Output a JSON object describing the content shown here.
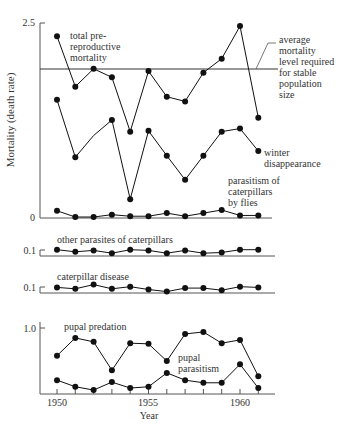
{
  "chart_data": [
    {
      "type": "line",
      "panel": "top",
      "title": "",
      "xlabel": "",
      "ylabel": "Mortality (death rate)",
      "ylim": [
        0,
        2.5
      ],
      "yticks": [
        "0",
        "2.5"
      ],
      "grid": false,
      "x": [
        1950,
        1951,
        1952,
        1953,
        1954,
        1955,
        1956,
        1957,
        1958,
        1959,
        1960,
        1961
      ],
      "reference_line": {
        "value": 1.9,
        "label": [
          "average",
          "mortality",
          "level required",
          "for stable",
          "population",
          "size"
        ]
      },
      "series": [
        {
          "name": "total pre-reproductive mortality",
          "label_lines": [
            "total pre-",
            "reproductive",
            "mortality"
          ],
          "values": [
            2.33,
            1.68,
            1.91,
            1.8,
            1.1,
            1.88,
            1.55,
            1.49,
            1.86,
            2.04,
            2.46,
            1.28
          ],
          "markers": [
            true,
            true,
            true,
            true,
            true,
            true,
            true,
            true,
            true,
            true,
            true,
            true
          ]
        },
        {
          "name": "winter disappearance",
          "label_lines": [
            "winter",
            "disappearance"
          ],
          "values": [
            1.51,
            0.77,
            1.05,
            1.25,
            0.23,
            1.11,
            0.79,
            0.48,
            0.79,
            1.1,
            1.14,
            0.85
          ],
          "markers": [
            true,
            true,
            false,
            true,
            true,
            true,
            true,
            true,
            true,
            true,
            true,
            true
          ]
        },
        {
          "name": "parasitism of caterpillars by flies",
          "label_lines": [
            "parasitism of",
            "caterpillars",
            "by flies"
          ],
          "values": [
            0.08,
            0.0,
            0.0,
            0.03,
            0.01,
            0.01,
            0.05,
            0.01,
            0.05,
            0.09,
            0.02,
            0.02
          ],
          "markers": [
            true,
            true,
            true,
            true,
            true,
            true,
            true,
            true,
            true,
            true,
            true,
            true
          ]
        }
      ]
    },
    {
      "type": "line",
      "panel": "middle-1",
      "title": "other parasites of caterpillars",
      "ylim": [
        0,
        0.1
      ],
      "yticks": [
        "0.1"
      ],
      "x": [
        1950,
        1951,
        1952,
        1953,
        1954,
        1955,
        1956,
        1957,
        1958,
        1959,
        1960,
        1961
      ],
      "series": [
        {
          "name": "other parasites of caterpillars",
          "values": [
            0.09,
            0.06,
            0.08,
            0.04,
            0.09,
            0.08,
            0.04,
            0.08,
            0.04,
            0.05,
            0.09,
            0.09
          ]
        }
      ]
    },
    {
      "type": "line",
      "panel": "middle-2",
      "title": "caterpillar disease",
      "ylim": [
        0,
        0.1
      ],
      "yticks": [
        "0.1"
      ],
      "x": [
        1950,
        1951,
        1952,
        1953,
        1954,
        1955,
        1956,
        1957,
        1958,
        1959,
        1960,
        1961
      ],
      "series": [
        {
          "name": "caterpillar disease",
          "values": [
            0.08,
            0.06,
            0.12,
            0.06,
            0.09,
            0.05,
            0.02,
            0.07,
            0.07,
            0.04,
            0.09,
            0.08
          ]
        }
      ]
    },
    {
      "type": "line",
      "panel": "bottom",
      "xlabel": "Year",
      "ylim": [
        0,
        1.0
      ],
      "yticks": [
        "1.0"
      ],
      "xticks": [
        "1950",
        "1955",
        "1960"
      ],
      "x": [
        1950,
        1951,
        1952,
        1953,
        1954,
        1955,
        1956,
        1957,
        1958,
        1959,
        1960,
        1961
      ],
      "series": [
        {
          "name": "pupal predation",
          "label_lines": [
            "pupal predation"
          ],
          "values": [
            0.58,
            0.85,
            0.79,
            0.36,
            0.77,
            0.76,
            0.5,
            0.91,
            0.94,
            0.77,
            0.82,
            0.27
          ]
        },
        {
          "name": "pupal parasitism",
          "label_lines": [
            "pupal",
            "parasitism"
          ],
          "values": [
            0.21,
            0.11,
            0.06,
            0.18,
            0.09,
            0.11,
            0.32,
            0.21,
            0.17,
            0.17,
            0.45,
            0.09
          ]
        }
      ]
    }
  ],
  "labels": {
    "y_axis_title": "Mortality (death rate)",
    "top_y_max": "2.5",
    "top_y_zero": "0",
    "total_l1": "total pre-",
    "total_l2": "reproductive",
    "total_l3": "mortality",
    "ref_l1": "average",
    "ref_l2": "mortality",
    "ref_l3": "level required",
    "ref_l4": "for stable",
    "ref_l5": "population",
    "ref_l6": "size",
    "winter_l1": "winter",
    "winter_l2": "disappearance",
    "flies_l1": "parasitism of",
    "flies_l2": "caterpillars",
    "flies_l3": "by flies",
    "other_title": "other parasites of caterpillars",
    "other_tick": "0.1",
    "disease_title": "caterpillar disease",
    "disease_tick": "0.1",
    "bottom_tick": "1.0",
    "predation_label": "pupal predation",
    "parasitism_l1": "pupal",
    "parasitism_l2": "parasitism",
    "x_1950": "1950",
    "x_1955": "1955",
    "x_1960": "1960",
    "x_title": "Year"
  },
  "colors": {
    "ink": "#111111",
    "axis": "#555555",
    "text": "#333333",
    "background": "#ffffff"
  }
}
